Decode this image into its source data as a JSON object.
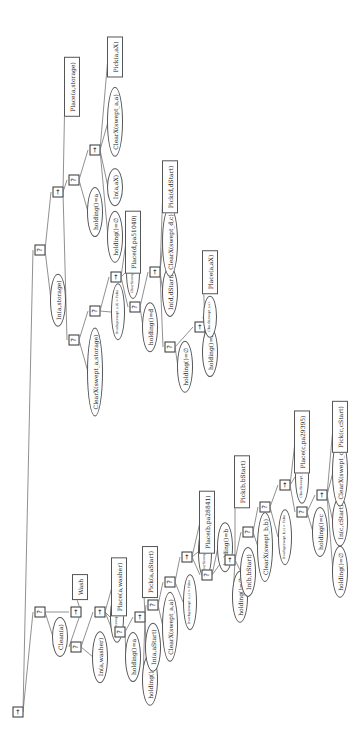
{
  "diagram": {
    "type": "behavior-tree",
    "orientation": "rotated-90-ccw",
    "symbols": {
      "sequence": "→",
      "fallback": "?"
    },
    "nodes": [
      {
        "id": "n0",
        "kind": "sequence",
        "label": "→",
        "x": 35,
        "y": 18
      },
      {
        "id": "n1",
        "kind": "fallback",
        "label": "?",
        "x": 135,
        "y": 40
      },
      {
        "id": "n2",
        "kind": "sequence",
        "label": "→",
        "x": 135,
        "y": 76
      },
      {
        "id": "n3",
        "kind": "fallback",
        "label": "?",
        "x": 497,
        "y": 40
      },
      {
        "id": "c_clean",
        "kind": "condition",
        "label": "Clean(a)",
        "x": 110,
        "y": 60
      },
      {
        "id": "a_wash",
        "kind": "action",
        "label": "Wash",
        "x": 160,
        "y": 80
      },
      {
        "id": "n4",
        "kind": "fallback",
        "label": "?",
        "x": 100,
        "y": 76
      },
      {
        "id": "c_inwasher",
        "kind": "condition",
        "label": "In(a,washer)",
        "x": 90,
        "y": 100
      },
      {
        "id": "n5",
        "kind": "sequence",
        "label": "→",
        "x": 135,
        "y": 100
      },
      {
        "id": "c_clearwasher",
        "kind": "condition",
        "label": "ClearX(swept_a,washer)",
        "x": 130,
        "y": 117,
        "small": true
      },
      {
        "id": "a_placewasher",
        "kind": "action",
        "label": "Place(a,washer)",
        "x": 160,
        "y": 119
      },
      {
        "id": "n6",
        "kind": "fallback",
        "label": "?",
        "x": 115,
        "y": 120
      },
      {
        "id": "c_holdinga",
        "kind": "condition",
        "label": "holding()=a",
        "x": 90,
        "y": 133
      },
      {
        "id": "n7",
        "kind": "sequence",
        "label": "→",
        "x": 130,
        "y": 140
      },
      {
        "id": "c_holdingnil1",
        "kind": "condition",
        "label": "holding()=∅",
        "x": 67,
        "y": 150
      },
      {
        "id": "c_inastart",
        "kind": "condition",
        "label": "In(a,aStart)",
        "x": 100,
        "y": 153
      },
      {
        "id": "n8",
        "kind": "fallback",
        "label": "?",
        "x": 142,
        "y": 153
      },
      {
        "id": "a_pickastart",
        "kind": "action",
        "label": "Pick(a,aStart)",
        "x": 175,
        "y": 150
      },
      {
        "id": "c_clearxaa",
        "kind": "condition",
        "label": "ClearX(swept_a,a)",
        "x": 120,
        "y": 170
      },
      {
        "id": "n9",
        "kind": "fallback",
        "label": "?",
        "x": 165,
        "y": 170
      },
      {
        "id": "c_overlap_a",
        "kind": "condition",
        "label": "Overlap(swept_a,c) = False",
        "x": 145,
        "y": 190,
        "small": true
      },
      {
        "id": "n10",
        "kind": "sequence",
        "label": "→",
        "x": 190,
        "y": 187
      },
      {
        "id": "c_clearbpa",
        "kind": "condition",
        "label": "ClearX(swept_b,pa28841)",
        "x": 195,
        "y": 205,
        "small": true
      },
      {
        "id": "a_placebpa",
        "kind": "action",
        "label": "Place(b,pa28841)",
        "x": 225,
        "y": 207
      },
      {
        "id": "n11",
        "kind": "fallback",
        "label": "?",
        "x": 172,
        "y": 207
      },
      {
        "id": "c_holdingb",
        "kind": "condition",
        "label": "holding()=b",
        "x": 200,
        "y": 225
      },
      {
        "id": "c_holdingnil2",
        "kind": "condition",
        "label": "holding()=∅",
        "x": 150,
        "y": 240
      },
      {
        "id": "n12",
        "kind": "sequence",
        "label": "→",
        "x": 187,
        "y": 230
      },
      {
        "id": "c_inbstart",
        "kind": "condition",
        "label": "In(b,bStart)",
        "x": 175,
        "y": 248
      },
      {
        "id": "n13",
        "kind": "fallback",
        "label": "?",
        "x": 215,
        "y": 248
      },
      {
        "id": "a_pickbstart",
        "kind": "action",
        "label": "Pick(b,bStart)",
        "x": 265,
        "y": 242
      },
      {
        "id": "c_clearxbb",
        "kind": "condition",
        "label": "ClearX(swept_b,b)",
        "x": 200,
        "y": 265
      },
      {
        "id": "n14",
        "kind": "fallback",
        "label": "?",
        "x": 240,
        "y": 265
      },
      {
        "id": "c_overlap_b",
        "kind": "condition",
        "label": "Overlap(swept_b,c) = False",
        "x": 210,
        "y": 285,
        "small": true
      },
      {
        "id": "n15",
        "kind": "sequence",
        "label": "→",
        "x": 262,
        "y": 285
      },
      {
        "id": "c_clearcpa",
        "kind": "condition",
        "label": "ClearX(swept_c,pa29395)",
        "x": 270,
        "y": 302,
        "small": true
      },
      {
        "id": "a_placecpa",
        "kind": "action",
        "label": "Place(c,pa29395)",
        "x": 305,
        "y": 302
      },
      {
        "id": "n16",
        "kind": "fallback",
        "label": "?",
        "x": 235,
        "y": 302
      },
      {
        "id": "c_holdingc",
        "kind": "condition",
        "label": "holding()=c",
        "x": 215,
        "y": 320
      },
      {
        "id": "n17",
        "kind": "sequence",
        "label": "→",
        "x": 252,
        "y": 322
      },
      {
        "id": "c_holdingnil3",
        "kind": "condition",
        "label": "holding()=∅",
        "x": 175,
        "y": 340
      },
      {
        "id": "c_incstart",
        "kind": "condition",
        "label": "In(c,cStart)",
        "x": 225,
        "y": 340
      },
      {
        "id": "c_clearxcc",
        "kind": "condition",
        "label": "ClearX(swept_c,c)",
        "x": 275,
        "y": 340
      },
      {
        "id": "a_pickcstart",
        "kind": "action",
        "label": "Pick(c,cStart)",
        "x": 320,
        "y": 340
      },
      {
        "id": "c_inastorage",
        "kind": "condition",
        "label": "In(a,storage)",
        "x": 447,
        "y": 58
      },
      {
        "id": "n18",
        "kind": "sequence",
        "label": "→",
        "x": 555,
        "y": 58
      },
      {
        "id": "n19",
        "kind": "fallback",
        "label": "?",
        "x": 407,
        "y": 74
      },
      {
        "id": "c_clearstorage",
        "kind": "condition",
        "label": "ClearX(swept_a,storage)",
        "x": 375,
        "y": 95
      },
      {
        "id": "n20",
        "kind": "fallback",
        "label": "?",
        "x": 436,
        "y": 95
      },
      {
        "id": "c_overlap_d",
        "kind": "condition",
        "label": "Overlap(swept_a,d) = False",
        "x": 435,
        "y": 118,
        "small": true
      },
      {
        "id": "n21",
        "kind": "sequence",
        "label": "→",
        "x": 470,
        "y": 116
      },
      {
        "id": "c_cleardpa",
        "kind": "condition",
        "label": "ClearX(swept_d,pa51040)",
        "x": 475,
        "y": 133,
        "small": true
      },
      {
        "id": "a_placedpa",
        "kind": "action",
        "label": "Place(d,pa51040)",
        "x": 505,
        "y": 133
      },
      {
        "id": "n22",
        "kind": "fallback",
        "label": "?",
        "x": 440,
        "y": 135
      },
      {
        "id": "c_holdingd",
        "kind": "condition",
        "label": "holding()=d",
        "x": 420,
        "y": 150
      },
      {
        "id": "n23",
        "kind": "sequence",
        "label": "→",
        "x": 475,
        "y": 155
      },
      {
        "id": "c_indstart",
        "kind": "condition",
        "label": "In(d,dStart)",
        "x": 455,
        "y": 170
      },
      {
        "id": "c_clearxdc",
        "kind": "condition",
        "label": "ClearX(swept_d,c)",
        "x": 505,
        "y": 170
      },
      {
        "id": "a_pickdstart",
        "kind": "action",
        "label": "Pick(d,dStart)",
        "x": 560,
        "y": 170
      },
      {
        "id": "n24",
        "kind": "fallback",
        "label": "?",
        "x": 400,
        "y": 170
      },
      {
        "id": "c_holdingnil4",
        "kind": "condition",
        "label": "holding()=∅",
        "x": 380,
        "y": 185
      },
      {
        "id": "n25",
        "kind": "sequence",
        "label": "→",
        "x": 420,
        "y": 200
      },
      {
        "id": "c_holdinga2",
        "kind": "condition",
        "label": "holding()=a",
        "x": 395,
        "y": 210
      },
      {
        "id": "c_clearaa2",
        "kind": "condition",
        "label": "ClearX(swept_a,a)",
        "x": 430,
        "y": 210,
        "small": true
      },
      {
        "id": "a_placeax",
        "kind": "action",
        "label": "Place(a,aX)",
        "x": 475,
        "y": 210
      },
      {
        "id": "n26",
        "kind": "fallback",
        "label": "?",
        "x": 567,
        "y": 74
      },
      {
        "id": "a_placestorage",
        "kind": "action",
        "label": "Place(a,storage)",
        "x": 660,
        "y": 72
      },
      {
        "id": "c_holdinga3",
        "kind": "condition",
        "label": "holding()=a",
        "x": 535,
        "y": 95
      },
      {
        "id": "n27",
        "kind": "sequence",
        "label": "→",
        "x": 597,
        "y": 95
      },
      {
        "id": "c_holdingnil5",
        "kind": "condition",
        "label": "holding()=∅",
        "x": 510,
        "y": 115
      },
      {
        "id": "c_inax",
        "kind": "condition",
        "label": "In(a,aX)",
        "x": 560,
        "y": 115
      },
      {
        "id": "c_clearxaa3",
        "kind": "condition",
        "label": "ClearX(swept_a,a)",
        "x": 625,
        "y": 115
      },
      {
        "id": "a_pickax",
        "kind": "action",
        "label": "Pick(a,aX)",
        "x": 690,
        "y": 115
      }
    ],
    "edges": [
      [
        "n0",
        "n1"
      ],
      [
        "n0",
        "n3"
      ],
      [
        "n1",
        "c_clean"
      ],
      [
        "n1",
        "n2"
      ],
      [
        "n2",
        "n4"
      ],
      [
        "n2",
        "a_wash"
      ],
      [
        "n4",
        "c_inwasher"
      ],
      [
        "n4",
        "n5"
      ],
      [
        "n5",
        "n6"
      ],
      [
        "n5",
        "c_clearwasher"
      ],
      [
        "n5",
        "a_placewasher"
      ],
      [
        "n6",
        "c_holdinga"
      ],
      [
        "n6",
        "n7"
      ],
      [
        "n7",
        "c_holdingnil1"
      ],
      [
        "n7",
        "c_inastart"
      ],
      [
        "n7",
        "n8"
      ],
      [
        "n7",
        "a_pickastart"
      ],
      [
        "n8",
        "c_clearxaa"
      ],
      [
        "n8",
        "n9"
      ],
      [
        "n9",
        "c_overlap_a"
      ],
      [
        "n9",
        "n10"
      ],
      [
        "n10",
        "n11"
      ],
      [
        "n10",
        "c_clearbpa"
      ],
      [
        "n10",
        "a_placebpa"
      ],
      [
        "n11",
        "c_holdingb"
      ],
      [
        "n11",
        "n12"
      ],
      [
        "n12",
        "c_holdingnil2"
      ],
      [
        "n12",
        "c_inbstart"
      ],
      [
        "n12",
        "n13"
      ],
      [
        "n12",
        "a_pickbstart"
      ],
      [
        "n13",
        "c_clearxbb"
      ],
      [
        "n13",
        "n14"
      ],
      [
        "n14",
        "c_overlap_b"
      ],
      [
        "n14",
        "n15"
      ],
      [
        "n15",
        "n16"
      ],
      [
        "n15",
        "c_clearcpa"
      ],
      [
        "n15",
        "a_placecpa"
      ],
      [
        "n16",
        "c_holdingc"
      ],
      [
        "n16",
        "n17"
      ],
      [
        "n17",
        "c_holdingnil3"
      ],
      [
        "n17",
        "c_incstart"
      ],
      [
        "n17",
        "c_clearxcc"
      ],
      [
        "n17",
        "a_pickcstart"
      ],
      [
        "n3",
        "c_inastorage"
      ],
      [
        "n3",
        "n18"
      ],
      [
        "n18",
        "n19"
      ],
      [
        "n18",
        "n26"
      ],
      [
        "n18",
        "a_placestorage"
      ],
      [
        "n19",
        "c_clearstorage"
      ],
      [
        "n19",
        "n20"
      ],
      [
        "n20",
        "c_overlap_d"
      ],
      [
        "n20",
        "n21"
      ],
      [
        "n21",
        "n22"
      ],
      [
        "n21",
        "c_cleardpa"
      ],
      [
        "n21",
        "a_placedpa"
      ],
      [
        "n22",
        "c_holdingd"
      ],
      [
        "n22",
        "n23"
      ],
      [
        "n23",
        "n24"
      ],
      [
        "n23",
        "c_indstart"
      ],
      [
        "n23",
        "c_clearxdc"
      ],
      [
        "n23",
        "a_pickdstart"
      ],
      [
        "n24",
        "c_holdingnil4"
      ],
      [
        "n24",
        "n25"
      ],
      [
        "n25",
        "c_holdinga2"
      ],
      [
        "n25",
        "c_clearaa2"
      ],
      [
        "n25",
        "a_placeax"
      ],
      [
        "n26",
        "c_holdinga3"
      ],
      [
        "n26",
        "n27"
      ],
      [
        "n27",
        "c_holdingnil5"
      ],
      [
        "n27",
        "c_inax"
      ],
      [
        "n27",
        "c_clearxaa3"
      ],
      [
        "n27",
        "a_pickax"
      ]
    ],
    "colors": {
      "line": "#444444",
      "border": "#555555",
      "background": "#ffffff",
      "text": "#222222"
    }
  }
}
